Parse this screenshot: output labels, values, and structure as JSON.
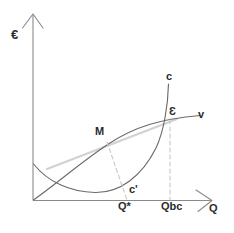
{
  "figure": {
    "type": "economics-diagram",
    "background_color": "#ffffff",
    "axes": {
      "y_axis": {
        "label": "€",
        "color": "#8a8a8a",
        "arrow": true
      },
      "x_axis": {
        "label": "Q",
        "color": "#8a8a8a",
        "arrow": true
      },
      "origin_label": ""
    },
    "curves": [
      {
        "name": "v",
        "label": "v",
        "description": "concave increasing revenue curve from origin",
        "color": "#6b6b6b",
        "style": "solid"
      },
      {
        "name": "c",
        "label": "c",
        "description": "U-shaped cost curve rising steeply on the right",
        "color": "#6b6b6b",
        "style": "solid"
      },
      {
        "name": "tangent",
        "label": "",
        "description": "light grey tangent line touching v at M",
        "color": "#cfcfcf",
        "style": "solid"
      }
    ],
    "points": [
      {
        "name": "M",
        "label": "M",
        "description": "tangency point on v curve"
      },
      {
        "name": "E",
        "label": "Ɛ",
        "description": "intersection of c and v curves"
      }
    ],
    "guides": [
      {
        "name": "m-guide",
        "from": "M",
        "to": "Q*",
        "style": "dashed",
        "color": "#c8c8c8"
      },
      {
        "name": "qbc-guide",
        "from": "Ɛ",
        "to": "Qbc",
        "style": "dashed",
        "color": "#c8c8c8"
      }
    ],
    "axis_ticks": [
      {
        "name": "q-star",
        "label": "Q*"
      },
      {
        "name": "q-bc",
        "label": "Qbc"
      }
    ],
    "annotations": [
      {
        "name": "c-prime",
        "label": "c'",
        "description": "label for the lower cost curve branch"
      }
    ],
    "labels": {
      "euro": "€",
      "q": "Q",
      "c": "c",
      "c_prime": "c'",
      "v": "v",
      "m": "M",
      "epsilon": "Ɛ",
      "q_star": "Q*",
      "q_bc": "Qbc"
    },
    "colors": {
      "axis": "#8a8a8a",
      "curve": "#6b6b6b",
      "guide": "#c8c8c8",
      "tangent": "#cfcfcf",
      "text": "#2b2b2b"
    }
  }
}
